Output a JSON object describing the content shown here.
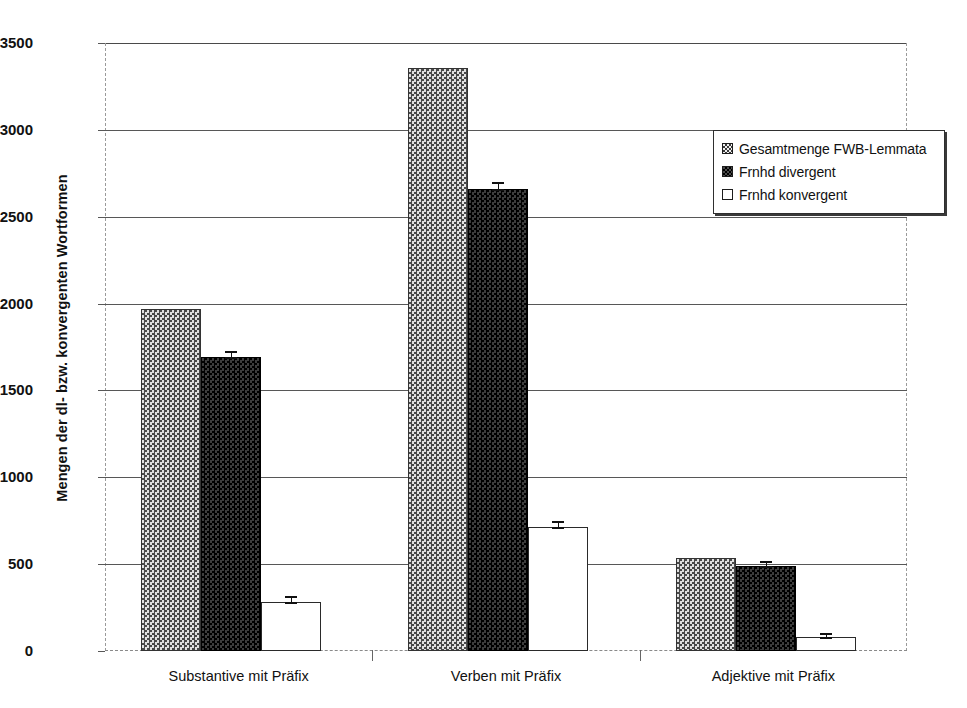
{
  "chart_data": {
    "type": "bar",
    "title": "",
    "xlabel": "",
    "ylabel": "Mengen der dl- bzw. konvergenten Wortformen",
    "ylim": [
      0,
      3500
    ],
    "ytick_values": [
      0,
      500,
      1000,
      1500,
      2000,
      2500,
      3000,
      3500
    ],
    "ytick_labels": [
      "0",
      "500",
      "1000",
      "1500",
      "2000",
      "2500",
      "3000",
      "3500"
    ],
    "grid": true,
    "legend_position": "upper right",
    "categories": [
      "Substantive mit Präfix",
      "Verben mit Präfix",
      "Adjektive mit Präfix"
    ],
    "series": [
      {
        "name": "Gesamtmenge FWB-Lemmata",
        "values": [
          1968,
          3357,
          535
        ],
        "errors": [
          0,
          0,
          0
        ]
      },
      {
        "name": "Frnhd divergent",
        "values": [
          1692,
          2662,
          492
        ],
        "errors": [
          18,
          20,
          12
        ]
      },
      {
        "name": "Frnhd konvergent",
        "values": [
          280,
          713,
          78
        ],
        "errors": [
          18,
          18,
          8
        ]
      }
    ]
  },
  "legend": {
    "items": [
      {
        "label": "Gesamtmenge FWB-Lemmata",
        "swatch": "checkered-light-swatch"
      },
      {
        "label": "Frnhd divergent",
        "swatch": "checkered-dark-swatch"
      },
      {
        "label": "Frnhd konvergent",
        "swatch": "white-outline-swatch"
      }
    ]
  }
}
